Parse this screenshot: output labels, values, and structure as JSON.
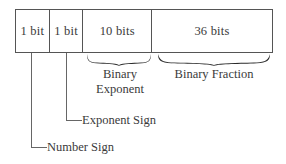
{
  "diagram": {
    "background_color": "#ffffff",
    "line_color": "#555555",
    "text_color": "#3a3a3a",
    "fields": [
      {
        "id": "number-sign",
        "label": "1 bit",
        "bits": 1
      },
      {
        "id": "exponent-sign",
        "label": "1 bit",
        "bits": 1
      },
      {
        "id": "binary-exponent",
        "label": "10 bits",
        "bits": 10
      },
      {
        "id": "binary-fraction",
        "label": "36 bits",
        "bits": 36
      }
    ],
    "group_labels": [
      {
        "id": "binary-exponent",
        "line1": "Binary",
        "line2": "Exponent"
      },
      {
        "id": "binary-fraction",
        "line1": "Binary Fraction",
        "line2": ""
      }
    ],
    "callouts": [
      {
        "id": "exponent-sign",
        "label": "Exponent Sign"
      },
      {
        "id": "number-sign",
        "label": "Number Sign"
      }
    ]
  }
}
